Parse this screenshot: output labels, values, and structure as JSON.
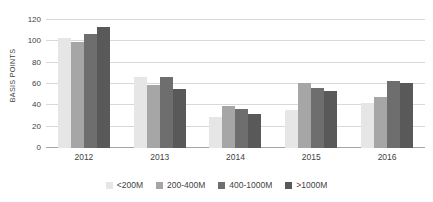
{
  "chart_data": {
    "type": "bar",
    "title": "",
    "xlabel": "",
    "ylabel": "BASIS POINTS",
    "ylim": [
      0,
      120
    ],
    "yticks": [
      0,
      20,
      40,
      60,
      80,
      100,
      120
    ],
    "grid": true,
    "legend_position": "bottom",
    "categories": [
      "2012",
      "2013",
      "2014",
      "2015",
      "2016"
    ],
    "series": [
      {
        "name": "<200M",
        "color": "#e6e6e6",
        "values": [
          103,
          67,
          29,
          36,
          42
        ]
      },
      {
        "name": "200-400M",
        "color": "#a6a6a6",
        "values": [
          99,
          59,
          39,
          61,
          48
        ]
      },
      {
        "name": "400-1000M",
        "color": "#6e6e6e",
        "values": [
          107,
          67,
          37,
          56,
          63
        ]
      },
      {
        "name": ">1000M",
        "color": "#595959",
        "values": [
          113,
          55,
          32,
          53,
          61
        ]
      }
    ]
  },
  "colors": {
    "gridline": "#d9d9d9",
    "axis": "#a6a6a6",
    "text": "#3f3f3f",
    "background": "#ffffff"
  }
}
